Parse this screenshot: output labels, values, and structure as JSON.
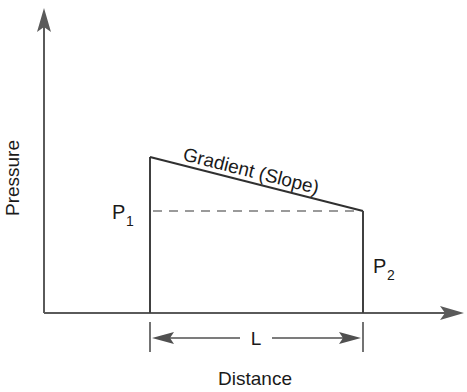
{
  "diagram": {
    "type": "pressure-gradient",
    "axes": {
      "y_label": "Pressure",
      "x_label": "Distance"
    },
    "labels": {
      "gradient": "Gradient (Slope)",
      "p1_main": "P",
      "p1_sub": "1",
      "p2_main": "P",
      "p2_sub": "2",
      "length": "L"
    },
    "colors": {
      "line": "#505050",
      "dashed": "#7a7a7a",
      "text": "#1a1a1a"
    }
  }
}
